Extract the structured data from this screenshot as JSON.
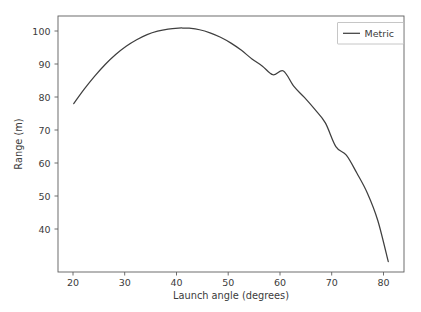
{
  "figure": {
    "background_color": "#ffffff",
    "axes_color": "#5e5e5e",
    "text_color": "#3b3b3b"
  },
  "chart_data": {
    "type": "line",
    "title": "",
    "xlabel": "Launch angle (degrees)",
    "ylabel": "Range (m)",
    "xlim": [
      17.0,
      83.0
    ],
    "ylim": [
      29.0,
      103.5
    ],
    "xticks": [
      20,
      30,
      40,
      50,
      60,
      70,
      80
    ],
    "xtick_labels": [
      "20",
      "30",
      "40",
      "50",
      "60",
      "70",
      "80"
    ],
    "yticks": [
      40,
      50,
      60,
      70,
      80,
      90,
      100
    ],
    "ytick_labels": [
      "40",
      "50",
      "60",
      "70",
      "80",
      "90",
      "100"
    ],
    "grid": false,
    "legend_position": "upper right",
    "series": [
      {
        "name": "Metric",
        "color": "#3f3f3f",
        "linewidth": 1.25,
        "linestyle": "solid",
        "x": [
          20,
          22,
          24,
          26,
          28,
          30,
          32,
          34,
          36,
          38,
          40,
          41,
          42,
          44,
          46,
          48,
          50,
          52,
          54,
          56,
          58,
          60,
          62,
          64,
          66,
          68,
          70,
          72,
          74,
          76,
          78,
          80
        ],
        "y": [
          78.0,
          82.2,
          86.0,
          89.4,
          92.3,
          94.7,
          96.6,
          98.1,
          99.1,
          99.7,
          99.98,
          100.0,
          99.95,
          99.5,
          98.6,
          97.3,
          95.6,
          93.5,
          91.0,
          88.9,
          86.4,
          87.5,
          83.0,
          79.8,
          76.3,
          72.4,
          65.5,
          63.0,
          57.8,
          52.0,
          44.0,
          32.0
        ]
      }
    ],
    "annotations": []
  },
  "legend": {
    "entries": [
      {
        "label": "Metric",
        "color": "#3f3f3f"
      }
    ]
  }
}
